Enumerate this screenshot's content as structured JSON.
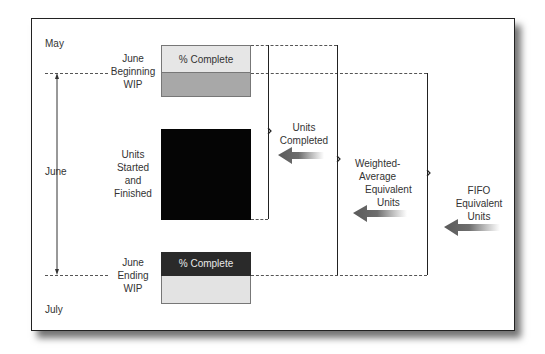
{
  "periods": {
    "start": "May",
    "current": "June",
    "end": "July"
  },
  "blocks": {
    "beginning_wip": {
      "label_lines": [
        "June",
        "Beginning",
        "WIP"
      ],
      "top_text": "% Complete",
      "top_color": "#e6e6e6",
      "bottom_color": "#a8a8a8"
    },
    "started_finished": {
      "label_lines": [
        "Units",
        "Started",
        "and",
        "Finished"
      ],
      "color": "#050505"
    },
    "ending_wip": {
      "label_lines": [
        "June",
        "Ending",
        "WIP"
      ],
      "top_text": "% Complete",
      "top_color": "#2a2a2a",
      "bottom_color": "#e3e3e3"
    }
  },
  "brackets": {
    "units_completed": {
      "label_lines": [
        "Units",
        "Completed"
      ]
    },
    "weighted_average": {
      "label_lines": [
        "Weighted-",
        "Average",
        "Equivalent",
        "Units"
      ]
    },
    "fifo": {
      "label_lines": [
        "FIFO",
        "Equivalent",
        "Units"
      ]
    }
  },
  "icons": {
    "arrows": [
      "left-arrow-icon",
      "left-arrow-icon",
      "left-arrow-icon"
    ],
    "timeline": "double-arrow-vertical-icon"
  },
  "colors": {
    "arrow": "#6e6e6e",
    "frame_border": "#222222",
    "dashed_line": "#555555"
  }
}
